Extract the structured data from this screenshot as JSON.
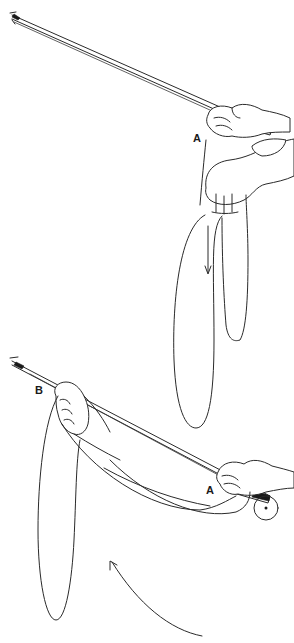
{
  "figure": {
    "colors": {
      "ink": "#2a2a2a",
      "background": "#ffffff"
    },
    "top_panel": {
      "labels": [
        {
          "id": "A",
          "text": "A"
        }
      ],
      "arrow": "downward pull arrow inside loop"
    },
    "bottom_panel": {
      "labels": [
        {
          "id": "B",
          "text": "B"
        },
        {
          "id": "A",
          "text": "A"
        }
      ],
      "arrow": "curved arrow pointing up-left"
    }
  }
}
